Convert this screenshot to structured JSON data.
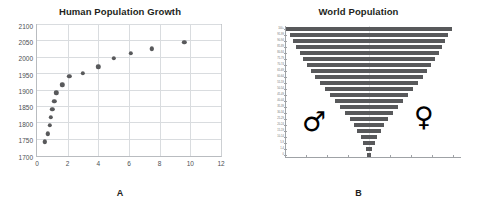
{
  "figure": {
    "background": "#ffffff",
    "marker_color": "#58595b",
    "bar_color": "#58595b",
    "grid_color": "#d9dcdf",
    "text_color": "#231f20"
  },
  "panels": [
    {
      "letter": "A",
      "title": "Human Population Growth"
    },
    {
      "letter": "B",
      "title": "World Population"
    }
  ],
  "symbols": {
    "male": "♂",
    "female": "♀"
  },
  "chart_data": [
    {
      "type": "scatter",
      "title": "Human Population Growth",
      "panel": "A",
      "xlabel": "",
      "ylabel": "",
      "xlim": [
        0,
        12
      ],
      "ylim": [
        1700,
        2100
      ],
      "xticks": [
        0,
        2,
        4,
        6,
        8,
        10,
        12
      ],
      "yticks": [
        1700,
        1750,
        1800,
        1850,
        1900,
        1950,
        2000,
        2050,
        2100
      ],
      "xtick_labels": [
        "0",
        "2",
        "4",
        "6",
        "8",
        "10",
        "12"
      ],
      "ytick_labels": [
        "1700",
        "1750",
        "1800",
        "1850",
        "1900",
        "1950",
        "2000",
        "2050",
        "2100"
      ],
      "grid": true,
      "legend": "none",
      "x": [
        0.5,
        0.72,
        0.82,
        0.92,
        1.0,
        1.12,
        1.25,
        1.65,
        2.1,
        3.0,
        4.0,
        5.0,
        6.1,
        7.5,
        9.6
      ],
      "y": [
        1750,
        1775,
        1800,
        1825,
        1850,
        1875,
        1900,
        1925,
        1950,
        1960,
        1980,
        2005,
        2020,
        2035,
        2055
      ],
      "series": [
        {
          "name": "World population (billions) vs year",
          "points": [
            {
              "x": 0.5,
              "y": 1750
            },
            {
              "x": 0.72,
              "y": 1775
            },
            {
              "x": 0.82,
              "y": 1800
            },
            {
              "x": 0.92,
              "y": 1825
            },
            {
              "x": 1.0,
              "y": 1850
            },
            {
              "x": 1.12,
              "y": 1875
            },
            {
              "x": 1.25,
              "y": 1900
            },
            {
              "x": 1.65,
              "y": 1925
            },
            {
              "x": 2.1,
              "y": 1950
            },
            {
              "x": 3.0,
              "y": 1960
            },
            {
              "x": 4.0,
              "y": 1980
            },
            {
              "x": 5.0,
              "y": 2005
            },
            {
              "x": 6.1,
              "y": 2020
            },
            {
              "x": 7.5,
              "y": 2035
            },
            {
              "x": 9.6,
              "y": 2055
            }
          ]
        }
      ]
    },
    {
      "type": "bar",
      "subtype": "population-pyramid-inverted",
      "title": "World Population",
      "panel": "B",
      "xlabel": "",
      "ylabel": "",
      "grid": false,
      "legend": "none",
      "orientation": "horizontal",
      "categories": [
        "100+",
        "95-99",
        "90-94",
        "85-89",
        "80-84",
        "75-79",
        "70-74",
        "65-69",
        "60-64",
        "55-59",
        "50-54",
        "45-49",
        "40-44",
        "35-39",
        "30-34",
        "25-29",
        "20-24",
        "15-19",
        "10-14",
        "5-9",
        "1-4",
        "0"
      ],
      "series": [
        {
          "name": "Male",
          "side": "left",
          "values": [
            100,
            96,
            92,
            88,
            84,
            80,
            75,
            70,
            65,
            59,
            53,
            47,
            41,
            35,
            29,
            23,
            18,
            14,
            10,
            7,
            4,
            2
          ]
        },
        {
          "name": "Female",
          "side": "right",
          "values": [
            100,
            96,
            92,
            88,
            84,
            80,
            75,
            70,
            65,
            59,
            53,
            47,
            41,
            35,
            29,
            23,
            18,
            14,
            10,
            7,
            4,
            2
          ]
        }
      ]
    }
  ]
}
